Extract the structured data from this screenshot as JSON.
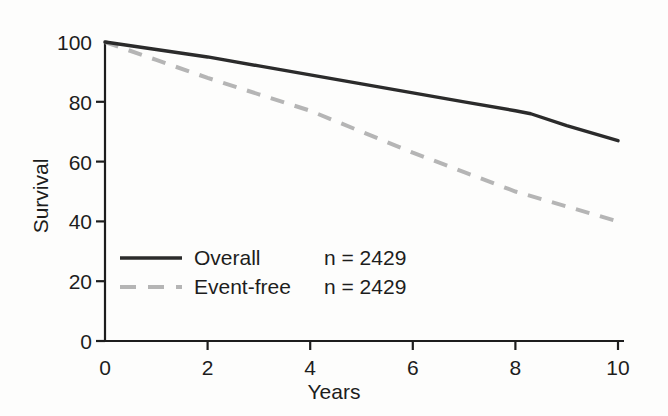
{
  "chart_data": {
    "type": "line",
    "title": "",
    "subtitle": "",
    "xlabel": "Years",
    "ylabel": "Survival",
    "xlim": [
      0,
      10
    ],
    "ylim": [
      0,
      100
    ],
    "xticks": [
      0,
      2,
      4,
      6,
      8,
      10
    ],
    "yticks": [
      0,
      20,
      40,
      60,
      80,
      100
    ],
    "xtick_labels": [
      "0",
      "2",
      "4",
      "6",
      "8",
      "10"
    ],
    "ytick_labels": [
      "0",
      "20",
      "40",
      "60",
      "80",
      "100"
    ],
    "grid": false,
    "legend_position": "inside-lower-left",
    "series": [
      {
        "name": "Overall",
        "annotation": "n = 2429",
        "style": "solid",
        "color": "#2b2b2b",
        "x": [
          0,
          1,
          2,
          3,
          4,
          5,
          6,
          7,
          8,
          8.3,
          9,
          10
        ],
        "values": [
          100,
          97.5,
          95,
          92,
          89,
          86,
          83,
          80,
          77,
          76,
          72,
          67
        ]
      },
      {
        "name": "Event-free",
        "annotation": "n = 2429",
        "style": "dashed",
        "color": "#b5b5b5",
        "x": [
          0,
          1,
          2,
          3,
          4,
          5,
          6,
          7,
          8,
          9,
          10
        ],
        "values": [
          100,
          94,
          88,
          82.5,
          77,
          70,
          63,
          56.5,
          50,
          45,
          40
        ]
      }
    ]
  },
  "axis": {
    "x_title": "Years",
    "y_title": "Survival"
  },
  "legend": {
    "rows": [
      {
        "name": "Overall",
        "n": "n = 2429"
      },
      {
        "name": "Event-free",
        "n": "n = 2429"
      }
    ]
  },
  "colors": {
    "overall": "#2b2b2b",
    "event_free": "#b5b5b5",
    "axis": "#1d1d1d",
    "background": "#fdfdfc"
  }
}
